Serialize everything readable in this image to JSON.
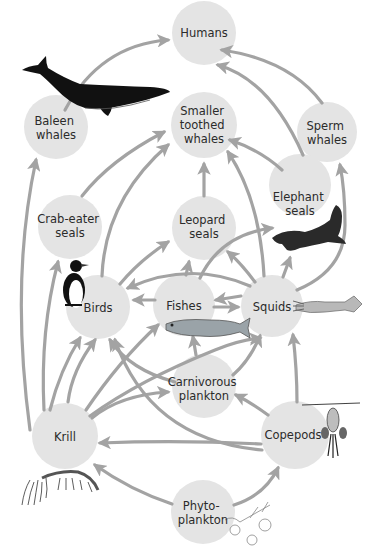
{
  "colors": {
    "node_fill": "#e4e4e4",
    "arrow": "#a3a3a3",
    "label": "#2b2b2b",
    "background": "#ffffff"
  },
  "nodes": {
    "humans": {
      "lines": [
        "Humans"
      ]
    },
    "baleen_whales": {
      "lines": [
        "Baleen",
        "whales"
      ]
    },
    "smaller_toothed_whales": {
      "lines": [
        "Smaller",
        "toothed",
        "whales"
      ]
    },
    "sperm_whales": {
      "lines": [
        "Sperm",
        "whales"
      ]
    },
    "crab_eater_seals": {
      "lines": [
        "Crab-eater",
        "seals"
      ]
    },
    "leopard_seals": {
      "lines": [
        "Leopard",
        "seals"
      ]
    },
    "elephant_seals": {
      "lines": [
        "Elephant",
        "seals"
      ]
    },
    "birds": {
      "lines": [
        "Birds"
      ]
    },
    "fishes": {
      "lines": [
        "Fishes"
      ]
    },
    "squids": {
      "lines": [
        "Squids"
      ]
    },
    "carnivorous_plankton": {
      "lines": [
        "Carnivorous",
        "plankton"
      ]
    },
    "krill": {
      "lines": [
        "Krill"
      ]
    },
    "copepods": {
      "lines": [
        "Copepods"
      ]
    },
    "phytoplankton": {
      "lines": [
        "Phyto-",
        "plankton"
      ]
    }
  },
  "illustrations": [
    "whale",
    "penguin",
    "elephant-seal",
    "fish",
    "squid",
    "krill",
    "copepod",
    "phytoplankton"
  ]
}
